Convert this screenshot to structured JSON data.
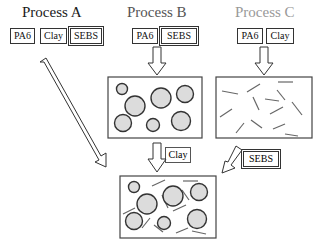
{
  "processes": [
    {
      "title": "Process A",
      "color": "#1a1a1a",
      "components": [
        "PA6",
        "Clay",
        "SEBS"
      ]
    },
    {
      "title": "Process B",
      "color": "#555555",
      "components": [
        "PA6",
        "SEBS"
      ]
    },
    {
      "title": "Process C",
      "color": "#999999",
      "components": [
        "PA6",
        "Clay"
      ]
    }
  ],
  "step_labels": {
    "b_to_final": "Clay",
    "c_to_final": "SEBS"
  },
  "morphologies": {
    "b": "SEBS droplets dispersed in PA6 matrix",
    "c": "Clay platelets dispersed in PA6 matrix",
    "final": "SEBS droplets and clay platelets in PA6 matrix"
  }
}
